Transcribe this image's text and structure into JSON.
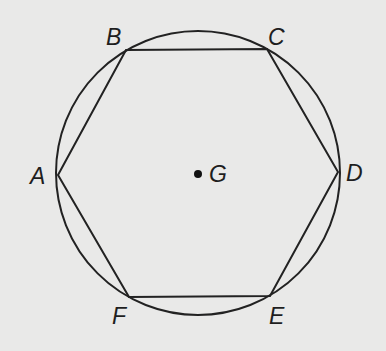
{
  "figure": {
    "type": "regular hexagon inscribed in a circle",
    "background_color": "#e9e9e8",
    "stroke_color": "#222222",
    "circle": {
      "name": "circle-G",
      "center": [
        198,
        173
      ],
      "radius": 142
    },
    "center_point": {
      "label": "G",
      "position": [
        198,
        174
      ],
      "label_position": [
        209,
        182
      ]
    },
    "hexagon": {
      "name": "hexagon-ABCDEF",
      "vertices": [
        {
          "label": "A",
          "position": [
            58,
            175
          ],
          "label_position": [
            30,
            184
          ]
        },
        {
          "label": "B",
          "position": [
            126,
            50
          ],
          "label_position": [
            106,
            45
          ]
        },
        {
          "label": "C",
          "position": [
            267,
            49
          ],
          "label_position": [
            268,
            45
          ]
        },
        {
          "label": "D",
          "position": [
            338,
            172
          ],
          "label_position": [
            346,
            181
          ]
        },
        {
          "label": "E",
          "position": [
            270,
            296
          ],
          "label_position": [
            269,
            324
          ]
        },
        {
          "label": "F",
          "position": [
            129,
            297
          ],
          "label_position": [
            112,
            324
          ]
        }
      ],
      "points_string": "58,175 126,50 267,49 338,172 270,296 129,297"
    }
  }
}
